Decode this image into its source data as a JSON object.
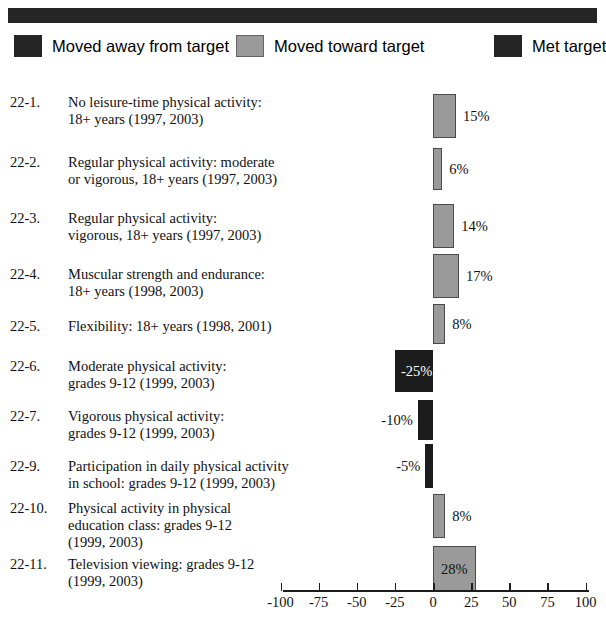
{
  "legend": {
    "items": [
      {
        "label": "Moved away from target",
        "color": "#262626",
        "key": "away"
      },
      {
        "label": "Moved toward target",
        "color": "#9a9a9a",
        "key": "toward"
      },
      {
        "label": "Met target",
        "color": "#262626",
        "key": "met"
      }
    ]
  },
  "chart_data": {
    "type": "bar",
    "orientation": "horizontal",
    "title": "",
    "xlabel": "",
    "ylabel": "",
    "xlim": [
      -100,
      100
    ],
    "xticks": [
      -100,
      -75,
      -50,
      -25,
      0,
      25,
      50,
      75,
      100
    ],
    "xticklabels": [
      "-100",
      "-75",
      "-50",
      "-25",
      "0",
      "25",
      "50",
      "75",
      "100"
    ],
    "grid": false,
    "legend_position": "top",
    "categories": [
      {
        "index": "22-1.",
        "lines": [
          "No leisure-time physical activity:",
          "18+ years  (1997, 2003)"
        ],
        "value": 15,
        "label": "15%",
        "series": "Moved toward target"
      },
      {
        "index": "22-2.",
        "lines": [
          "Regular physical activity:  moderate",
          "or vigorous, 18+ years  (1997, 2003)"
        ],
        "value": 6,
        "label": "6%",
        "series": "Moved toward target"
      },
      {
        "index": "22-3.",
        "lines": [
          "Regular physical activity:",
          "vigorous, 18+ years  (1997, 2003)"
        ],
        "value": 14,
        "label": "14%",
        "series": "Moved toward target"
      },
      {
        "index": "22-4.",
        "lines": [
          "Muscular strength and endurance:",
          "18+ years  (1998, 2003)"
        ],
        "value": 17,
        "label": "17%",
        "series": "Moved toward target"
      },
      {
        "index": "22-5.",
        "lines": [
          "Flexibility:  18+ years  (1998, 2001)"
        ],
        "value": 8,
        "label": "8%",
        "series": "Moved toward target"
      },
      {
        "index": "22-6.",
        "lines": [
          "Moderate physical activity:",
          "grades 9-12  (1999, 2003)"
        ],
        "value": -25,
        "label": "-25%",
        "series": "Moved away from target"
      },
      {
        "index": "22-7.",
        "lines": [
          "Vigorous physical activity:",
          "grades 9-12  (1999, 2003)"
        ],
        "value": -10,
        "label": "-10%",
        "series": "Moved away from target"
      },
      {
        "index": "22-9.",
        "lines": [
          "Participation in daily physical activity",
          "in school:  grades 9-12  (1999, 2003)"
        ],
        "value": -5,
        "label": "-5%",
        "series": "Moved away from target"
      },
      {
        "index": "22-10.",
        "lines": [
          "Physical activity in physical",
          "education class:  grades 9-12",
          "(1999, 2003)"
        ],
        "value": 8,
        "label": "8%",
        "series": "Moved toward target"
      },
      {
        "index": "22-11.",
        "lines": [
          "Television viewing:  grades 9-12",
          "(1999, 2003)"
        ],
        "value": 28,
        "label": "28%",
        "series": "Moved toward target"
      }
    ]
  },
  "colors": {
    "bar_positive": "#9a9a9a",
    "bar_negative": "#1c1c1c",
    "band": "#262626",
    "axis": "#1c1c1c"
  }
}
